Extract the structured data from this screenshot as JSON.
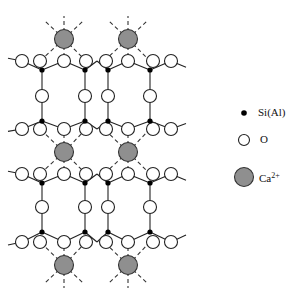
{
  "diagram": {
    "title": "",
    "colors": {
      "ca": "#8f8f8f",
      "si": "#000000",
      "o": "#ffffff",
      "stroke": "#222222"
    },
    "xcols": {
      "o": [
        22,
        40,
        64,
        86,
        106,
        128,
        153,
        171
      ],
      "si": [
        42,
        85,
        108,
        150
      ],
      "ca": [
        64,
        128
      ]
    },
    "layers": [
      {
        "o_y": 61,
        "si_y": 70,
        "side": "top"
      },
      {
        "o_y": 129,
        "si_y": 121,
        "side": "bottom"
      },
      {
        "o_y": 174,
        "si_y": 183,
        "side": "top"
      },
      {
        "o_y": 242,
        "si_y": 232,
        "side": "bottom"
      }
    ],
    "bridge_o_y": [
      96,
      207
    ],
    "ca_rows": [
      {
        "y": 39,
        "up": true,
        "down_to": 61
      },
      {
        "y": 152,
        "up_to": 129,
        "down_to": 174
      },
      {
        "y": 265,
        "down": true,
        "up_to": 242
      }
    ]
  },
  "legend": {
    "items": [
      {
        "symbol": "si",
        "label": "Si(Al)",
        "x": 244,
        "y": 113
      },
      {
        "symbol": "o",
        "label": "O",
        "x": 244,
        "y": 140
      },
      {
        "symbol": "ca",
        "label": "Ca",
        "sup": "2+",
        "x": 244,
        "y": 177
      }
    ]
  }
}
